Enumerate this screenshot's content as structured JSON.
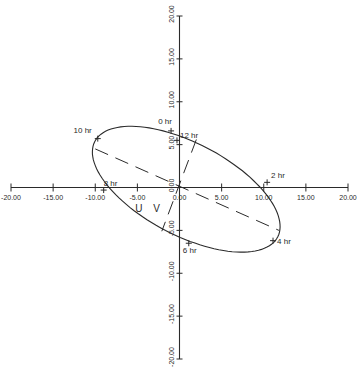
{
  "chart_data": {
    "type": "line",
    "title": "",
    "xlabel": "",
    "ylabel": "",
    "xlim": [
      -20,
      20
    ],
    "ylim": [
      -20,
      20
    ],
    "grid": false,
    "x_ticks": [
      -20,
      -15,
      -10,
      -5,
      0,
      5,
      10,
      15,
      20
    ],
    "y_ticks": [
      -20,
      -15,
      -10,
      -5,
      0,
      5,
      10,
      15,
      20
    ],
    "x_tick_labels": [
      "-20.00",
      "-15.00",
      "-10.00",
      "-5.00",
      "0.00",
      "5.00",
      "10.00",
      "15.00",
      "20.00"
    ],
    "y_tick_labels": [
      "-20.00",
      "-15.00",
      "-10.00",
      "-5.00",
      "0.00",
      "5.00",
      "10.00",
      "15.00",
      "20.00"
    ],
    "axis_label_uv": "U V",
    "ellipse": {
      "center": [
        0.8,
        -0.2
      ],
      "semi_major": 12.2,
      "semi_minor": 5.4,
      "angle_deg": -27
    },
    "major_axis_dashed": {
      "from": [
        -10.0,
        4.5
      ],
      "to": [
        11.8,
        -5.0
      ]
    },
    "minor_axis_dashed": {
      "from": [
        2.0,
        5.6
      ],
      "to": [
        -2.1,
        -5.1
      ]
    },
    "points": [
      {
        "label": "0 hr",
        "x": -1.0,
        "y": 6.6
      },
      {
        "label": "2 hr",
        "x": 10.4,
        "y": 0.6
      },
      {
        "label": "4 hr",
        "x": 11.1,
        "y": -6.2
      },
      {
        "label": "6 hr",
        "x": 1.1,
        "y": -6.5
      },
      {
        "label": "8 hr",
        "x": -9.0,
        "y": -0.3
      },
      {
        "label": "10 hr",
        "x": -9.7,
        "y": 5.7
      },
      {
        "label": "12 hr",
        "x": -0.3,
        "y": 5.5
      }
    ]
  }
}
